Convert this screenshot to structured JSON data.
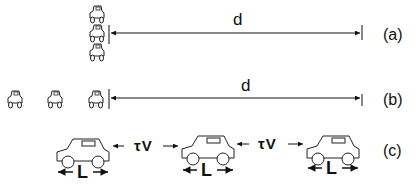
{
  "panels": [
    {
      "id": "a",
      "label": "(a)",
      "distance_label": "d",
      "description": "Three cars stacked vertically at the start line, distance d to finish line"
    },
    {
      "id": "b",
      "label": "(b)",
      "distance_label": "d",
      "description": "Three cars in a row behind start line, distance d to finish line"
    },
    {
      "id": "c",
      "label": "(c)",
      "gap_labels": [
        "τV",
        "τV"
      ],
      "length_labels": [
        "L",
        "L",
        "L"
      ],
      "description": "Three cars in a line, each of length L, separated by gap τV"
    }
  ],
  "colors": {
    "stroke": "#111111",
    "background": "#ffffff"
  }
}
